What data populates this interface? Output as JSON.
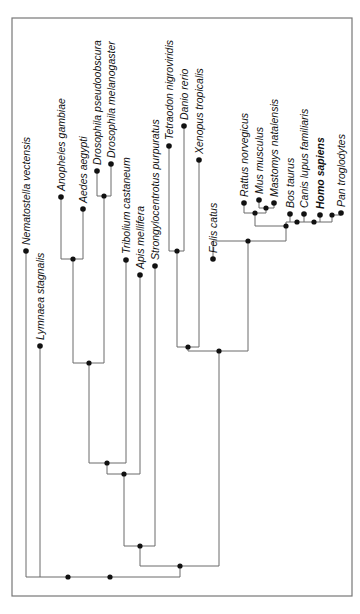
{
  "diagram": {
    "type": "phylogenetic-tree",
    "orientation": "rotated-90-ccw",
    "taxa": [
      {
        "name": "Nematostella vectensis",
        "x": 26,
        "y": 251,
        "bold": false
      },
      {
        "name": "Lymnaea stagnalis",
        "x": 40,
        "y": 346,
        "bold": false
      },
      {
        "name": "Anopheles gambiae",
        "x": 61,
        "y": 197,
        "bold": false
      },
      {
        "name": "Aedes aegypti",
        "x": 83,
        "y": 209,
        "bold": false
      },
      {
        "name": "Drosophila pseudoobscura",
        "x": 97,
        "y": 171,
        "bold": false
      },
      {
        "name": "Drosophila melanogaster",
        "x": 111,
        "y": 164,
        "bold": false
      },
      {
        "name": "Tribolium castaneum",
        "x": 126,
        "y": 260,
        "bold": false
      },
      {
        "name": "Apis mellifera",
        "x": 140,
        "y": 275,
        "bold": false
      },
      {
        "name": "Strongylocentrotus purpuratus",
        "x": 155,
        "y": 266,
        "bold": false
      },
      {
        "name": "Tetraodon nigroviridis",
        "x": 169,
        "y": 146,
        "bold": false
      },
      {
        "name": "Danio rerio",
        "x": 184,
        "y": 126,
        "bold": false
      },
      {
        "name": "Xenopus tropicalis",
        "x": 199,
        "y": 160,
        "bold": false
      },
      {
        "name": "Felis catus",
        "x": 213,
        "y": 259,
        "bold": false
      },
      {
        "name": "Rattus norvegicus",
        "x": 244,
        "y": 203,
        "bold": false
      },
      {
        "name": "Mus musculus",
        "x": 259,
        "y": 200,
        "bold": false
      },
      {
        "name": "Mastomys natalensis",
        "x": 274,
        "y": 203,
        "bold": false
      },
      {
        "name": "Bos taurus",
        "x": 290,
        "y": 214,
        "bold": false
      },
      {
        "name": "Canis lupus familiaris",
        "x": 304,
        "y": 214,
        "bold": false
      },
      {
        "name": "Homo sapiens",
        "x": 320,
        "y": 215,
        "bold": true
      },
      {
        "name": "Pan troglodytes",
        "x": 341,
        "y": 213,
        "bold": false
      }
    ],
    "colors": {
      "branch": "#6b6b6b",
      "node": "#111111",
      "frame": "#777777"
    }
  }
}
